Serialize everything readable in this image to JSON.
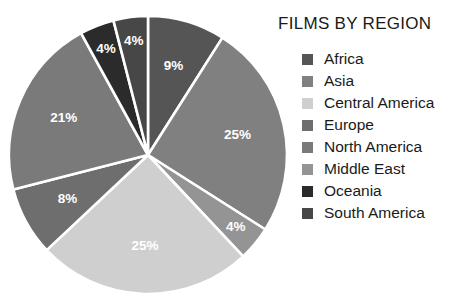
{
  "chart_data": {
    "type": "pie",
    "title": "FILMS BY REGION",
    "xlabel": "",
    "ylabel": "",
    "legend_position": "right",
    "grid": false,
    "start_angle_deg": 0,
    "direction": "clockwise",
    "categories": [
      "Africa",
      "Asia",
      "Central America",
      "Europe",
      "North America",
      "Middle East",
      "Oceania",
      "South America"
    ],
    "values": [
      9,
      25,
      4,
      8,
      21,
      25,
      4,
      4
    ],
    "value_labels": [
      "9%",
      "25%",
      "4%",
      "8%",
      "21%",
      "25%",
      "4%",
      "4%"
    ],
    "colors": [
      "#555555",
      "#808080",
      "#cfcfcf",
      "#6e6e6e",
      "#7a7a7a",
      "#949494",
      "#2b2b2b",
      "#474747"
    ],
    "slices_clockwise_from_top": [
      {
        "name": "Africa",
        "percent": 9,
        "label": "9%",
        "color": "#555555"
      },
      {
        "name": "Asia",
        "percent": 25,
        "label": "25%",
        "color": "#808080"
      },
      {
        "name": "Middle East",
        "percent": 4,
        "label": "4%",
        "color": "#949494"
      },
      {
        "name": "Central America",
        "percent": 25,
        "label": "25%",
        "color": "#cfcfcf"
      },
      {
        "name": "Europe",
        "percent": 8,
        "label": "8%",
        "color": "#6e6e6e"
      },
      {
        "name": "North America",
        "percent": 21,
        "label": "21%",
        "color": "#7a7a7a"
      },
      {
        "name": "Oceania",
        "percent": 4,
        "label": "4%",
        "color": "#2b2b2b"
      },
      {
        "name": "South America",
        "percent": 4,
        "label": "4%",
        "color": "#474747"
      }
    ],
    "slice_separator_color": "#ffffff"
  },
  "title": {
    "text": "FILMS BY REGION"
  },
  "legend": {
    "items": [
      {
        "label": "Africa",
        "color": "#555555"
      },
      {
        "label": "Asia",
        "color": "#808080"
      },
      {
        "label": "Central America",
        "color": "#cfcfcf"
      },
      {
        "label": "Europe",
        "color": "#6e6e6e"
      },
      {
        "label": "North America",
        "color": "#7a7a7a"
      },
      {
        "label": "Middle East",
        "color": "#949494"
      },
      {
        "label": "Oceania",
        "color": "#2b2b2b"
      },
      {
        "label": "South America",
        "color": "#474747"
      }
    ]
  }
}
